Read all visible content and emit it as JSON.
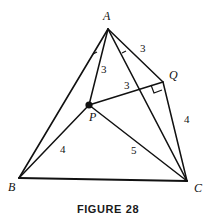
{
  "figure": {
    "caption": "FIGURE 28",
    "type": "geometry-diagram",
    "stroke_color": "#111111",
    "background_color": "#ffffff",
    "vertices": [
      {
        "name": "A",
        "label": "A",
        "x": 108,
        "y": 29,
        "label_x": 103,
        "label_y": 10
      },
      {
        "name": "B",
        "label": "B",
        "x": 19,
        "y": 178,
        "label_x": 8,
        "label_y": 181
      },
      {
        "name": "C",
        "label": "C",
        "x": 187,
        "y": 181,
        "label_x": 194,
        "label_y": 182
      },
      {
        "name": "P",
        "label": "P",
        "x": 89,
        "y": 105,
        "label_x": 89,
        "label_y": 111
      },
      {
        "name": "Q",
        "label": "Q",
        "x": 163,
        "y": 82,
        "label_x": 169,
        "label_y": 69
      }
    ],
    "segments": [
      {
        "name": "AB",
        "from": "A",
        "to": "B"
      },
      {
        "name": "AC",
        "from": "A",
        "to": "C"
      },
      {
        "name": "BC",
        "from": "B",
        "to": "C"
      },
      {
        "name": "AP",
        "from": "A",
        "to": "P"
      },
      {
        "name": "AQ",
        "from": "A",
        "to": "Q"
      },
      {
        "name": "PQ",
        "from": "P",
        "to": "Q"
      },
      {
        "name": "PB",
        "from": "P",
        "to": "B"
      },
      {
        "name": "PC",
        "from": "P",
        "to": "C"
      },
      {
        "name": "QC",
        "from": "Q",
        "to": "C"
      }
    ],
    "length_labels": [
      {
        "name": "length-AQ",
        "value": "3",
        "x": 140,
        "y": 43
      },
      {
        "name": "length-AP",
        "value": "3",
        "x": 101,
        "y": 64
      },
      {
        "name": "length-PQ",
        "value": "3",
        "x": 124,
        "y": 80
      },
      {
        "name": "length-QC",
        "value": "4",
        "x": 184,
        "y": 114
      },
      {
        "name": "length-BP",
        "value": "4",
        "x": 60,
        "y": 144
      },
      {
        "name": "length-PC",
        "value": "5",
        "x": 131,
        "y": 145
      }
    ],
    "angle_marks": [
      {
        "name": "angle-mark-BAP",
        "x": 95,
        "y": 53
      },
      {
        "name": "angle-mark-PAQ",
        "x": 124,
        "y": 52
      }
    ],
    "right_angle": {
      "name": "right-angle-at-Q",
      "x": 163,
      "y": 82
    }
  }
}
